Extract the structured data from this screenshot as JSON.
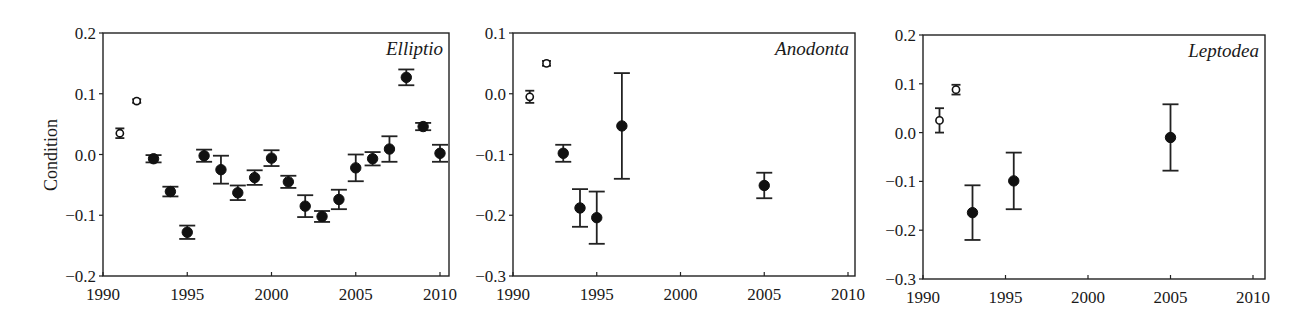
{
  "figure": {
    "ylabel": "Condition"
  },
  "chart_data": [
    {
      "type": "scatter",
      "title": "Elliptio",
      "xlabel": "",
      "ylabel": "Condition",
      "xlim": [
        1990,
        2010
      ],
      "ylim": [
        -0.2,
        0.2
      ],
      "xticks": [
        1990,
        1995,
        2000,
        2005,
        2010
      ],
      "yticks": [
        -0.2,
        -0.1,
        0.0,
        0.1,
        0.2
      ],
      "ytick_labels": [
        "−0.2",
        "−0.1",
        "0.0",
        "0.1",
        "0.2"
      ],
      "grid": false,
      "points": [
        {
          "x": 1991,
          "y": 0.035,
          "err": 0.008,
          "filled": false
        },
        {
          "x": 1992,
          "y": 0.088,
          "err": 0.003,
          "filled": false
        },
        {
          "x": 1993,
          "y": -0.007,
          "err": 0.006,
          "filled": true
        },
        {
          "x": 1994,
          "y": -0.061,
          "err": 0.008,
          "filled": true
        },
        {
          "x": 1995,
          "y": -0.128,
          "err": 0.011,
          "filled": true
        },
        {
          "x": 1996,
          "y": -0.002,
          "err": 0.01,
          "filled": true
        },
        {
          "x": 1997,
          "y": -0.025,
          "err": 0.023,
          "filled": true
        },
        {
          "x": 1998,
          "y": -0.063,
          "err": 0.012,
          "filled": true
        },
        {
          "x": 1999,
          "y": -0.038,
          "err": 0.012,
          "filled": true
        },
        {
          "x": 2000,
          "y": -0.006,
          "err": 0.013,
          "filled": true
        },
        {
          "x": 2001,
          "y": -0.045,
          "err": 0.01,
          "filled": true
        },
        {
          "x": 2002,
          "y": -0.085,
          "err": 0.018,
          "filled": true
        },
        {
          "x": 2003,
          "y": -0.102,
          "err": 0.009,
          "filled": true
        },
        {
          "x": 2004,
          "y": -0.074,
          "err": 0.016,
          "filled": true
        },
        {
          "x": 2005,
          "y": -0.022,
          "err": 0.022,
          "filled": true
        },
        {
          "x": 2006,
          "y": -0.007,
          "err": 0.011,
          "filled": true
        },
        {
          "x": 2007,
          "y": 0.009,
          "err": 0.021,
          "filled": true
        },
        {
          "x": 2008,
          "y": 0.127,
          "err": 0.013,
          "filled": true
        },
        {
          "x": 2009,
          "y": 0.046,
          "err": 0.006,
          "filled": true
        },
        {
          "x": 2010,
          "y": 0.002,
          "err": 0.014,
          "filled": true
        }
      ],
      "frame": {
        "left": 103,
        "top": 33,
        "right": 449,
        "bottom": 276,
        "x0px": 103,
        "x1px": 440
      }
    },
    {
      "type": "scatter",
      "title": "Anodonta",
      "xlabel": "",
      "ylabel": "",
      "xlim": [
        1990,
        2010
      ],
      "ylim": [
        -0.3,
        0.1
      ],
      "xticks": [
        1990,
        1995,
        2000,
        2005,
        2010
      ],
      "yticks": [
        -0.3,
        -0.2,
        -0.1,
        0.0,
        0.1
      ],
      "ytick_labels": [
        "−0.3",
        "−0.2",
        "−0.1",
        "0.0",
        "0.1"
      ],
      "grid": false,
      "points": [
        {
          "x": 1991,
          "y": -0.005,
          "err": 0.01,
          "filled": false
        },
        {
          "x": 1992,
          "y": 0.05,
          "err": 0.004,
          "filled": false
        },
        {
          "x": 1993,
          "y": -0.098,
          "err": 0.014,
          "filled": true
        },
        {
          "x": 1994,
          "y": -0.188,
          "err": 0.031,
          "filled": true
        },
        {
          "x": 1995,
          "y": -0.204,
          "err": 0.043,
          "filled": true
        },
        {
          "x": 1996.5,
          "y": -0.053,
          "err": 0.087,
          "filled": true
        },
        {
          "x": 2005,
          "y": -0.151,
          "err": 0.021,
          "filled": true
        }
      ],
      "frame": {
        "left": 513,
        "top": 33,
        "right": 855,
        "bottom": 276,
        "x0px": 513,
        "x1px": 848
      }
    },
    {
      "type": "scatter",
      "title": "Leptodea",
      "xlabel": "",
      "ylabel": "",
      "xlim": [
        1990,
        2010
      ],
      "ylim": [
        -0.3,
        0.2
      ],
      "xticks": [
        1990,
        1995,
        2000,
        2005,
        2010
      ],
      "yticks": [
        -0.3,
        -0.2,
        -0.1,
        0.0,
        0.1,
        0.2
      ],
      "ytick_labels": [
        "−0.3",
        "−0.2",
        "−0.1",
        "0.0",
        "0.1",
        "0.2"
      ],
      "grid": false,
      "points": [
        {
          "x": 1991,
          "y": 0.025,
          "err": 0.025,
          "filled": false
        },
        {
          "x": 1992,
          "y": 0.088,
          "err": 0.01,
          "filled": false
        },
        {
          "x": 1993,
          "y": -0.164,
          "err": 0.056,
          "filled": true
        },
        {
          "x": 1995.5,
          "y": -0.099,
          "err": 0.058,
          "filled": true
        },
        {
          "x": 2005,
          "y": -0.01,
          "err": 0.068,
          "filled": true
        }
      ],
      "frame": {
        "left": 923,
        "top": 35,
        "right": 1265,
        "bottom": 279,
        "x0px": 923,
        "x1px": 1253
      }
    }
  ]
}
